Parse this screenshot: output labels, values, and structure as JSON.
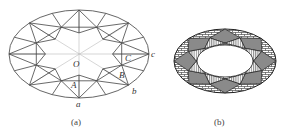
{
  "figure_a": {
    "caption": "(a)",
    "center": [
      79,
      54
    ],
    "rx": 70,
    "ry": 44,
    "stroke": "#555555",
    "labels": [
      {
        "text": "O",
        "x": 73,
        "y": 67
      },
      {
        "text": "A",
        "x": 71,
        "y": 88
      },
      {
        "text": "B",
        "x": 119,
        "y": 78
      },
      {
        "text": "C",
        "x": 125,
        "y": 61
      },
      {
        "text": "a",
        "x": 76,
        "y": 107
      },
      {
        "text": "b",
        "x": 132,
        "y": 94
      },
      {
        "text": "c",
        "x": 151,
        "y": 57
      }
    ],
    "caption_pos": [
      71,
      125
    ]
  },
  "figure_b": {
    "caption": "(b)",
    "center": [
      225,
      61
    ],
    "rx": 51,
    "ry": 32,
    "inner_rx": 28,
    "inner_ry": 16,
    "colors": {
      "kite_fill": "#8a8a8a",
      "stroke": "#222222",
      "brick": "#333333",
      "stripe": "#333333"
    },
    "caption_pos": [
      214,
      125
    ]
  },
  "chart_data": {
    "type": "diagram",
    "panels": [
      {
        "id": "a",
        "description": "Line drawing of oval brilliant crown facets with labeled points O, A, B, C and girdle points a, b, c"
      },
      {
        "id": "b",
        "description": "Same facet pattern rendered with fill patterns: gray kite facets, brick-patterned girdle facets, striped star facets around a white table"
      }
    ]
  }
}
